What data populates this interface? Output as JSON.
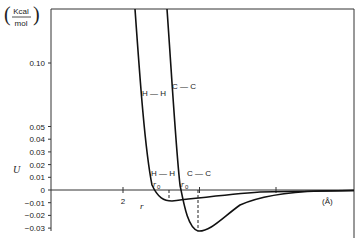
{
  "chart_data": {
    "type": "line",
    "title": "",
    "xlabel": "r",
    "xunit": "(Å)",
    "ylabel": "U",
    "yunit_numerator": "Kcal",
    "yunit_denominator": "mol",
    "x_ticks": [
      2,
      3,
      4
    ],
    "x_tick_labels": [
      "2",
      "",
      ""
    ],
    "y_ticks": [
      -0.03,
      -0.02,
      -0.01,
      0,
      0.01,
      0.02,
      0.03,
      0.04,
      0.05,
      0.1
    ],
    "y_tick_labels": [
      "−0.03",
      "−0.02",
      "−0.01",
      "0",
      "0.01",
      "0.02",
      "0.03",
      "0.04",
      "0.05",
      "0.10"
    ],
    "ylim": [
      -0.03,
      0.14
    ],
    "xlim": [
      1.6,
      4.6
    ],
    "grid": false,
    "axis_break_y": "between 0.05 and 0.10",
    "series": [
      {
        "name": "H — H",
        "label_upper": "H — H",
        "label_lower": "H — H",
        "r0_label": "r0",
        "points": [
          [
            2.15,
            0.14
          ],
          [
            2.25,
            0.06
          ],
          [
            2.35,
            0.005
          ],
          [
            2.39,
            0.0
          ],
          [
            2.47,
            -0.006
          ],
          [
            2.6,
            -0.009
          ],
          [
            2.8,
            -0.008
          ],
          [
            3.2,
            -0.004
          ],
          [
            3.6,
            -0.002
          ],
          [
            4.2,
            -0.001
          ],
          [
            4.6,
            -0.0005
          ]
        ],
        "minimum": {
          "r": 2.6,
          "U": -0.009
        }
      },
      {
        "name": "C — C",
        "label_upper": "C — C",
        "label_lower": "C — C",
        "r0_label": "r0",
        "points": [
          [
            2.58,
            0.14
          ],
          [
            2.68,
            0.06
          ],
          [
            2.76,
            0.005
          ],
          [
            2.75,
            0.0
          ],
          [
            2.85,
            -0.02
          ],
          [
            2.95,
            -0.031
          ],
          [
            3.1,
            -0.028
          ],
          [
            3.4,
            -0.014
          ],
          [
            3.8,
            -0.005
          ],
          [
            4.2,
            -0.002
          ],
          [
            4.6,
            -0.001
          ]
        ],
        "minimum": {
          "r": 2.95,
          "U": -0.033
        }
      }
    ]
  }
}
